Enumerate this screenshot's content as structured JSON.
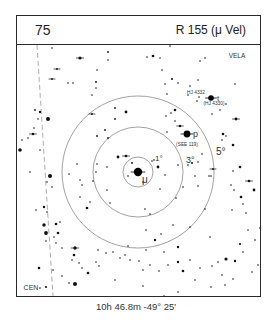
{
  "header": {
    "chart_number": "75",
    "title": "R 155 (μ Vel)"
  },
  "footer": {
    "coordinates": "10h 46.8m  -49° 25'"
  },
  "labels": {
    "constellation_top_right": "VELA",
    "constellation_bottom_left": "CEN",
    "center_star": "μ",
    "star_p": "p",
    "star_p_note": "(SEE 119)",
    "star_t": "t",
    "star_t_upper": "HJ 4332",
    "star_t_lower": "(HJ 4330)",
    "ring_1": "1°",
    "ring_3": "3°",
    "ring_5": "5°"
  },
  "chart_data": {
    "type": "star_chart",
    "center": {
      "x": 138,
      "y": 172,
      "name": "μ Vel"
    },
    "rings": [
      {
        "label": "1°",
        "r": 15
      },
      {
        "label": "3°",
        "r": 45
      },
      {
        "label": "5°",
        "r": 76
      }
    ],
    "constellation_boundary": {
      "x1": 37,
      "y1": 45,
      "x2": 53,
      "y2": 296,
      "style": "dashed"
    },
    "labeled_stars": [
      {
        "name": "μ",
        "x": 138,
        "y": 172,
        "r": 4.2,
        "double": true
      },
      {
        "name": "p",
        "x": 187,
        "y": 134,
        "r": 3.4,
        "double": true
      },
      {
        "name": "t",
        "x": 211,
        "y": 98,
        "r": 2.8,
        "double": true
      }
    ],
    "stars": [
      [
        52,
        48,
        0.8
      ],
      [
        80,
        58,
        1.6,
        1
      ],
      [
        57,
        69,
        0.9,
        1
      ],
      [
        52,
        79,
        0.9,
        1
      ],
      [
        68,
        83,
        0.8
      ],
      [
        73,
        83,
        0.8
      ],
      [
        96,
        82,
        0.9
      ],
      [
        108,
        52,
        0.9
      ],
      [
        108,
        60,
        0.8
      ],
      [
        97,
        70,
        0.8
      ],
      [
        96,
        88,
        0.8
      ],
      [
        92,
        95,
        0.8
      ],
      [
        92,
        114,
        0.9,
        1
      ],
      [
        35,
        110,
        0.9
      ],
      [
        40,
        112,
        1.2
      ],
      [
        48,
        119,
        2.0
      ],
      [
        38,
        119,
        0.8
      ],
      [
        33,
        134,
        1.3,
        1
      ],
      [
        34,
        128,
        0.8
      ],
      [
        22,
        140,
        0.8
      ],
      [
        28,
        138,
        0.8
      ],
      [
        20,
        150,
        1.8
      ],
      [
        40,
        150,
        0.8
      ],
      [
        105,
        130,
        0.9
      ],
      [
        97,
        136,
        0.9
      ],
      [
        108,
        138,
        0.9
      ],
      [
        115,
        108,
        0.9
      ],
      [
        115,
        119,
        0.9
      ],
      [
        126,
        112,
        1.4
      ],
      [
        50,
        176,
        2.0
      ],
      [
        47,
        182,
        0.8
      ],
      [
        30,
        172,
        0.8
      ],
      [
        52,
        187,
        0.8
      ],
      [
        69,
        174,
        0.8
      ],
      [
        77,
        164,
        0.8
      ],
      [
        97,
        164,
        0.8
      ],
      [
        96,
        172,
        0.8
      ],
      [
        80,
        180,
        0.8
      ],
      [
        93,
        181,
        0.8
      ],
      [
        82,
        185,
        0.8
      ],
      [
        87,
        208,
        1.3
      ],
      [
        90,
        202,
        0.8
      ],
      [
        80,
        197,
        0.8
      ],
      [
        44,
        207,
        1.2
      ],
      [
        36,
        210,
        0.8
      ],
      [
        47,
        212,
        0.8
      ],
      [
        44,
        225,
        1.7
      ],
      [
        46,
        233,
        1.9
      ],
      [
        56,
        224,
        1.3
      ],
      [
        58,
        233,
        1.3
      ],
      [
        60,
        222,
        0.8
      ],
      [
        54,
        237,
        0.8
      ],
      [
        46,
        241,
        0.8
      ],
      [
        56,
        243,
        0.8
      ],
      [
        62,
        248,
        0.8
      ],
      [
        75,
        248,
        1.7,
        1
      ],
      [
        74,
        255,
        1.3
      ],
      [
        72,
        260,
        0.8
      ],
      [
        39,
        268,
        1.3
      ],
      [
        53,
        270,
        0.8
      ],
      [
        62,
        276,
        0.8
      ],
      [
        69,
        283,
        0.8
      ],
      [
        40,
        288,
        0.8
      ],
      [
        46,
        287,
        1.1
      ],
      [
        75,
        284,
        2.0
      ],
      [
        107,
        167,
        0.8
      ],
      [
        118,
        157,
        1.4
      ],
      [
        107,
        190,
        0.8
      ],
      [
        110,
        203,
        0.8
      ],
      [
        126,
        156,
        1.3,
        1
      ],
      [
        132,
        163,
        0.9
      ],
      [
        128,
        176,
        0.8
      ],
      [
        143,
        182,
        0.8
      ],
      [
        152,
        161,
        0.8
      ],
      [
        154,
        160,
        0.8
      ],
      [
        158,
        167,
        1.4
      ],
      [
        160,
        189,
        0.8
      ],
      [
        165,
        175,
        0.8
      ],
      [
        178,
        165,
        0.8
      ],
      [
        188,
        165,
        0.8
      ],
      [
        192,
        163,
        1.0
      ],
      [
        198,
        162,
        0.8
      ],
      [
        183,
        187,
        0.8
      ],
      [
        198,
        186,
        0.8
      ],
      [
        195,
        176,
        0.8
      ],
      [
        209,
        176,
        0.8
      ],
      [
        213,
        169,
        0.9,
        1
      ],
      [
        176,
        198,
        0.8
      ],
      [
        145,
        209,
        0.8
      ],
      [
        150,
        214,
        0.8
      ],
      [
        146,
        230,
        0.8
      ],
      [
        161,
        234,
        0.8
      ],
      [
        155,
        240,
        1.2
      ],
      [
        128,
        246,
        0.8
      ],
      [
        146,
        250,
        0.8
      ],
      [
        164,
        252,
        0.8
      ],
      [
        178,
        247,
        1.2
      ],
      [
        173,
        225,
        0.8
      ],
      [
        190,
        227,
        0.8
      ],
      [
        205,
        209,
        0.8
      ],
      [
        210,
        237,
        0.8
      ],
      [
        226,
        259,
        1.6
      ],
      [
        218,
        262,
        0.8
      ],
      [
        235,
        261,
        1.2
      ],
      [
        211,
        176,
        0.8
      ],
      [
        202,
        154,
        0.8
      ],
      [
        167,
        132,
        0.8
      ],
      [
        180,
        126,
        1.2,
        1
      ],
      [
        175,
        121,
        0.8
      ],
      [
        175,
        110,
        1.3
      ],
      [
        171,
        113,
        0.8
      ],
      [
        166,
        116,
        0.8
      ],
      [
        167,
        94,
        0.8
      ],
      [
        162,
        70,
        0.8
      ],
      [
        153,
        56,
        1.3
      ],
      [
        160,
        58,
        0.8
      ],
      [
        147,
        57,
        0.8
      ],
      [
        170,
        46,
        0.8
      ],
      [
        165,
        84,
        0.8
      ],
      [
        172,
        79,
        1.0
      ],
      [
        178,
        83,
        0.8
      ],
      [
        190,
        86,
        0.8
      ],
      [
        198,
        80,
        0.8
      ],
      [
        200,
        61,
        0.8
      ],
      [
        205,
        58,
        0.8
      ],
      [
        199,
        97,
        0.8
      ],
      [
        197,
        101,
        0.8
      ],
      [
        188,
        95,
        0.8
      ],
      [
        212,
        114,
        0.8
      ],
      [
        220,
        110,
        0.8
      ],
      [
        226,
        104,
        0.8
      ],
      [
        236,
        119,
        1.4,
        1
      ],
      [
        235,
        84,
        0.8
      ],
      [
        223,
        134,
        1.3
      ],
      [
        226,
        136,
        0.8
      ],
      [
        222,
        140,
        0.8
      ],
      [
        233,
        145,
        1.3
      ],
      [
        240,
        167,
        1.3
      ],
      [
        233,
        171,
        0.8
      ],
      [
        231,
        185,
        0.8
      ],
      [
        234,
        190,
        0.8
      ],
      [
        241,
        197,
        1.3
      ],
      [
        243,
        204,
        0.8
      ],
      [
        246,
        213,
        0.8
      ],
      [
        232,
        210,
        0.8
      ],
      [
        254,
        190,
        1.4
      ],
      [
        249,
        181,
        1.3,
        1
      ],
      [
        260,
        228,
        0.8
      ],
      [
        248,
        230,
        0.8
      ],
      [
        240,
        244,
        1.0
      ],
      [
        243,
        252,
        0.8
      ],
      [
        255,
        240,
        0.8
      ],
      [
        258,
        265,
        0.8
      ],
      [
        252,
        272,
        0.8
      ],
      [
        233,
        279,
        0.8
      ],
      [
        225,
        285,
        0.8
      ],
      [
        211,
        287,
        0.8
      ],
      [
        195,
        280,
        0.8
      ],
      [
        178,
        292,
        0.8
      ],
      [
        164,
        296,
        0.8
      ],
      [
        143,
        286,
        0.8
      ],
      [
        115,
        280,
        0.8
      ],
      [
        99,
        266,
        0.8
      ],
      [
        96,
        262,
        0.8
      ],
      [
        88,
        273,
        1.3
      ],
      [
        82,
        268,
        0.8
      ],
      [
        79,
        263,
        0.8
      ],
      [
        98,
        250,
        0.8
      ],
      [
        106,
        253,
        0.8
      ],
      [
        113,
        252,
        0.8
      ],
      [
        120,
        258,
        0.8
      ],
      [
        125,
        255,
        0.8
      ],
      [
        130,
        260,
        0.8
      ],
      [
        139,
        261,
        0.8
      ],
      [
        143,
        270,
        0.8
      ],
      [
        150,
        265,
        0.8
      ],
      [
        159,
        271,
        0.8
      ],
      [
        168,
        265,
        0.8
      ],
      [
        178,
        262,
        1.2
      ],
      [
        183,
        271,
        1.3
      ],
      [
        190,
        260,
        0.8
      ],
      [
        200,
        268,
        0.8
      ],
      [
        212,
        266,
        0.8
      ],
      [
        222,
        275,
        0.8
      ]
    ]
  }
}
